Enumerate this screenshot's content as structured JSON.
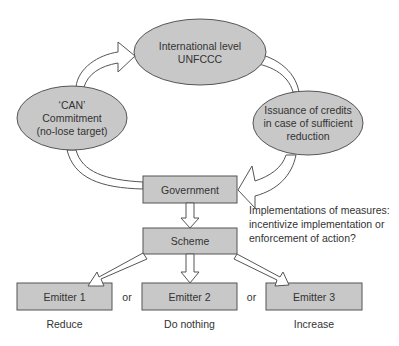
{
  "colors": {
    "shape_fill": "#c8c8c8",
    "stroke": "#555555",
    "arrow_fill": "#ffffff",
    "text": "#333333"
  },
  "nodes": {
    "international": {
      "line1": "International level",
      "line2": "UNFCCC"
    },
    "can": {
      "line1": "‘CAN’",
      "line2": "Commitment",
      "line3": "(no-lose target)"
    },
    "issuance": {
      "line1": "Issuance of credits",
      "line2": "in case of sufficient",
      "line3": "reduction"
    },
    "government": "Government",
    "scheme": "Scheme",
    "emitter1": "Emitter 1",
    "emitter2": "Emitter 2",
    "emitter3": "Emitter 3"
  },
  "connectors": {
    "or1": "or",
    "or2": "or"
  },
  "outcomes": {
    "emitter1": "Reduce",
    "emitter2": "Do nothing",
    "emitter3": "Increase"
  },
  "annotation": {
    "line1": "Implementations of measures:",
    "line2": "incentivize implementation or",
    "line3": "enforcement of action?"
  }
}
